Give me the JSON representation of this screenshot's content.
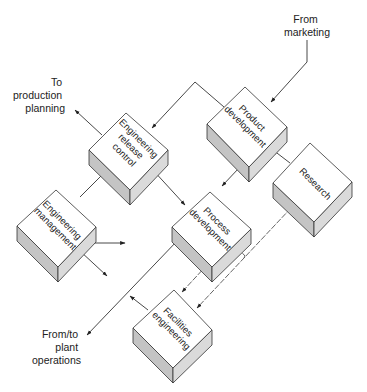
{
  "diagram": {
    "title": "",
    "nodes": [
      {
        "id": "product",
        "lines": [
          "Product",
          "development"
        ]
      },
      {
        "id": "erc",
        "lines": [
          "Engineering",
          "release",
          "control"
        ]
      },
      {
        "id": "research",
        "lines": [
          "Research"
        ]
      },
      {
        "id": "em",
        "lines": [
          "Engineering",
          "management"
        ]
      },
      {
        "id": "process",
        "lines": [
          "Process",
          "development"
        ]
      },
      {
        "id": "facilities",
        "lines": [
          "Facilities",
          "engineering"
        ]
      }
    ],
    "external_labels": {
      "marketing": [
        "From",
        "marketing"
      ],
      "production": [
        "To",
        "production",
        "planning"
      ],
      "plant": [
        "From/to",
        "plant",
        "operations"
      ]
    },
    "edges": [
      {
        "from": "marketing",
        "to": "product"
      },
      {
        "from": "product",
        "to": "erc"
      },
      {
        "from": "erc",
        "to": "production"
      },
      {
        "from": "em",
        "to": "erc"
      },
      {
        "from": "process",
        "to": "erc",
        "bidirectional": true
      },
      {
        "from": "product",
        "to": "process"
      },
      {
        "from": "research",
        "to": "product"
      },
      {
        "from": "research",
        "to": "facilities"
      },
      {
        "from": "facilities",
        "to": "process"
      },
      {
        "from": "process",
        "to": "facilities"
      },
      {
        "from": "plant",
        "to": "process",
        "bidirectional": true
      },
      {
        "from": "facilities",
        "to": "plant_line"
      },
      {
        "from": "em",
        "to": "outside_right"
      },
      {
        "from": "em",
        "to": "outside_down_right"
      }
    ]
  }
}
